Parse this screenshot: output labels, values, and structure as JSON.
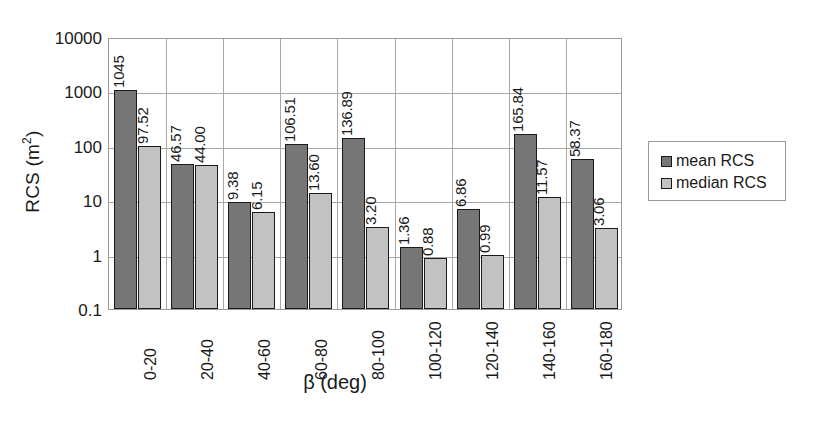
{
  "chart_data": {
    "type": "bar",
    "title": "",
    "xlabel": "β (deg)",
    "ylabel_text": "RCS (m",
    "ylabel_sup": "2",
    "ylabel_tail": ")",
    "ylabel_full": "RCS (m2)",
    "yscale": "log",
    "ylim": [
      0.1,
      10000
    ],
    "grid": true,
    "legend_position": "right",
    "yticks": [
      "10000",
      "1000",
      "100",
      "10",
      "1",
      "0.1"
    ],
    "ytick_values": [
      10000,
      1000,
      100,
      10,
      1,
      0.1
    ],
    "categories": [
      "0-20",
      "20-40",
      "40-60",
      "60-80",
      "80-100",
      "100-120",
      "120-140",
      "140-160",
      "160-180"
    ],
    "series": [
      {
        "name": "mean RCS",
        "color": "#767676",
        "values": [
          1045,
          46.57,
          9.38,
          106.51,
          136.89,
          1.36,
          6.86,
          165.84,
          58.37
        ],
        "labels": [
          "1045",
          "46.57",
          "9.38",
          "106.51",
          "136.89",
          "1.36",
          "6.86",
          "165.84",
          "58.37"
        ]
      },
      {
        "name": "median RCS",
        "color": "#c2c2c2",
        "values": [
          97.52,
          44.0,
          6.15,
          13.6,
          3.2,
          0.88,
          0.99,
          11.57,
          3.06
        ],
        "labels": [
          "97.52",
          "44.00",
          "6.15",
          "13.60",
          "3.20",
          "0.88",
          "0.99",
          "11.57",
          "3.06"
        ]
      }
    ]
  },
  "legend": {
    "items": [
      {
        "label": "mean RCS",
        "color": "#767676"
      },
      {
        "label": "median RCS",
        "color": "#c2c2c2"
      }
    ]
  }
}
